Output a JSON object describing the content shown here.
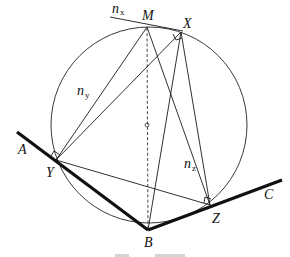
{
  "diagram": {
    "points": {
      "M": {
        "label": "M",
        "x": 147,
        "y": 27
      },
      "X": {
        "label": "X",
        "x": 181,
        "y": 32
      },
      "Y": {
        "label": "Y",
        "x": 56,
        "y": 160
      },
      "Z": {
        "label": "Z",
        "x": 210,
        "y": 205
      },
      "B": {
        "label": "B",
        "x": 148,
        "y": 230
      },
      "A": {
        "label": "A",
        "x": 17,
        "y": 132
      },
      "C": {
        "label": "C",
        "x": 282,
        "y": 180
      }
    },
    "labels": {
      "M": "M",
      "X": "X",
      "Y": "Y",
      "Z": "Z",
      "B": "B",
      "A": "A",
      "C": "C",
      "nx_main": "n",
      "nx_sub": "x",
      "ny_main": "n",
      "ny_sub": "y",
      "nz_main": "n",
      "nz_sub": "z"
    },
    "circle": {
      "cx": 149,
      "cy": 125,
      "r": 98
    },
    "colors": {
      "stroke": "#1a1a1a",
      "background": "#ffffff"
    }
  }
}
